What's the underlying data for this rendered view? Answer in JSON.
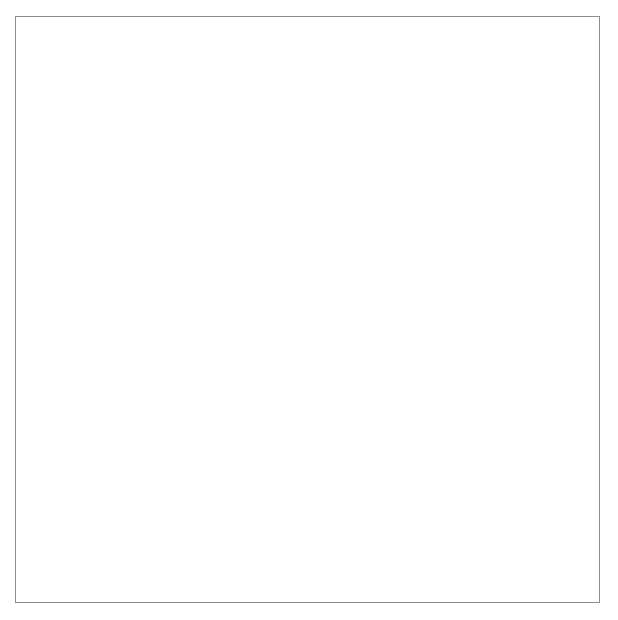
{
  "figure": {
    "kind": "fractal-circle-packing",
    "image_width": 618,
    "image_height": 620,
    "background_color": "#ffffff",
    "frame": {
      "x": 15,
      "y": 16,
      "width": 585,
      "height": 587,
      "border_color": "#8d8d8d",
      "border_width": 1
    },
    "colors": {
      "disk_gray": "#808080",
      "disk_white": "#ffffff",
      "outer_boundary": "#808080",
      "page_white": "#ffffff"
    },
    "outer_circle": {
      "cx": 308,
      "cy": 303,
      "r": 270,
      "fill": "#808080",
      "label": "bounding-disk"
    },
    "fade_region": {
      "note": "lower-left sector rendered with reduced contrast",
      "x": 16,
      "y": 330,
      "width": 260,
      "height": 272,
      "max_opacity": 0.52
    },
    "generation": {
      "max_depth": 9,
      "min_radius_px": 1.1,
      "alternating_fill": true,
      "note": "Descartes circle theorem recursion; child generations alternate white and gray"
    },
    "seed_circles": [
      {
        "name": "upper-white-lobe",
        "cx": 307,
        "cy": 148,
        "r": 92,
        "fill": "#ffffff"
      },
      {
        "name": "lower-white-lobe",
        "cx": 306,
        "cy": 478,
        "r": 90,
        "fill": "#ffffff"
      },
      {
        "name": "left-gray-disk",
        "cx": 108,
        "cy": 312,
        "r": 68,
        "fill": "#808080"
      },
      {
        "name": "right-gray-disk",
        "cx": 508,
        "cy": 305,
        "r": 68,
        "fill": "#808080"
      },
      {
        "name": "center-gray-disk",
        "cx": 308,
        "cy": 313,
        "r": 56,
        "fill": "#808080"
      },
      {
        "name": "upper-left-gray",
        "cx": 176,
        "cy": 199,
        "r": 38,
        "fill": "#808080"
      },
      {
        "name": "upper-right-gray",
        "cx": 436,
        "cy": 194,
        "r": 38,
        "fill": "#808080"
      },
      {
        "name": "lower-left-gray",
        "cx": 170,
        "cy": 412,
        "r": 36,
        "fill": "#808080"
      },
      {
        "name": "lower-right-gray",
        "cx": 443,
        "cy": 410,
        "r": 36,
        "fill": "#808080"
      }
    ],
    "notable_white_disks": [
      {
        "name": "ul-white-large",
        "cx": 117,
        "cy": 183,
        "r": 33
      },
      {
        "name": "ur-white-large",
        "cx": 504,
        "cy": 170,
        "r": 29
      },
      {
        "name": "mid-left-white",
        "cx": 220,
        "cy": 222,
        "r": 22
      },
      {
        "name": "mid-right-white",
        "cx": 384,
        "cy": 248,
        "r": 27
      },
      {
        "name": "ll-white-large",
        "cx": 131,
        "cy": 461,
        "r": 31
      },
      {
        "name": "lr-white-large",
        "cx": 500,
        "cy": 457,
        "r": 26
      },
      {
        "name": "center-lo-white",
        "cx": 237,
        "cy": 357,
        "r": 22
      },
      {
        "name": "right-mid-white",
        "cx": 406,
        "cy": 390,
        "r": 19
      }
    ],
    "caption": ""
  }
}
